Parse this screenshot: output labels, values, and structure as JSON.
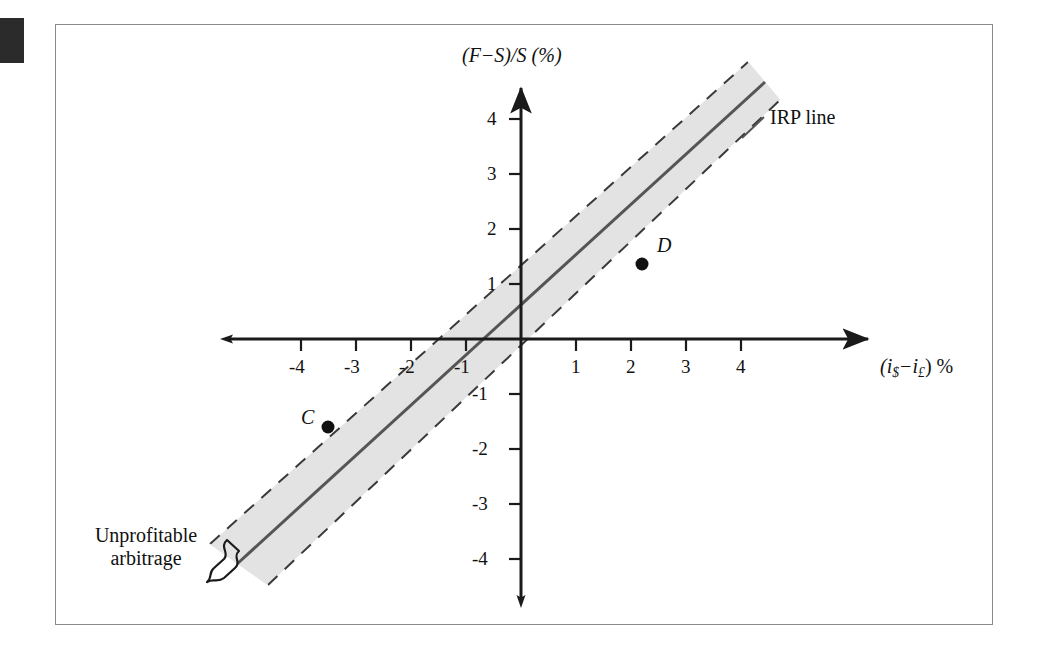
{
  "figure": {
    "type": "diagram",
    "axes": {
      "y_axis_label": "(F−S)/S (%)",
      "y_axis_label_parts": {
        "open": "(",
        "f": "F",
        "minus": "−",
        "s1": "S",
        "mid": ")/",
        "s2": "S",
        "units": " (%)"
      },
      "x_axis_label": "(i$−i£) %",
      "x_axis_label_parts": {
        "open": "(",
        "i1": "i",
        "sub1": "$",
        "minus": "−",
        "i2": "i",
        "sub2": "£",
        "close": ") %"
      },
      "x_ticks": [
        "-4",
        "-3",
        "-2",
        "-1",
        "1",
        "2",
        "3",
        "4"
      ],
      "y_ticks": [
        "4",
        "3",
        "2",
        "1",
        "-1",
        "-2",
        "-3",
        "-4"
      ],
      "x_range": [
        -5,
        5
      ],
      "y_range": [
        -5,
        5
      ]
    },
    "annotations": {
      "irp_line": "IRP line",
      "unprofitable_line1": "Unprofitable",
      "unprofitable_line2": "arbitrage"
    },
    "points": [
      {
        "id": "C",
        "label": "C",
        "x": -3.5,
        "y": -1.6,
        "label_side": "left"
      },
      {
        "id": "D",
        "label": "D",
        "x": 2.2,
        "y": 1.35,
        "label_side": "above-right"
      }
    ],
    "band": {
      "description": "shaded parallel band around the 45-degree IRP line",
      "fill": "#e3e3e3",
      "border_style": "dashed",
      "half_width_percent": 0.85
    },
    "colors": {
      "frame": "#8a8a8a",
      "axis": "#1a1a1a",
      "line": "#4a4a4a",
      "band_fill": "#e3e3e3",
      "band_edge": "#3a3a3a",
      "text": "#111111",
      "corner_block": "#2b2b2b",
      "background": "#ffffff"
    }
  }
}
